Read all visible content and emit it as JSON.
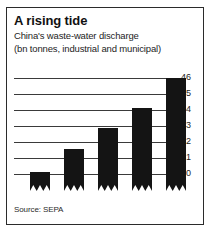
{
  "chart_data": {
    "type": "bar",
    "title": "A rising tide",
    "subtitle_line1": "China's waste-water discharge",
    "subtitle_line2": "(bn tonnes, industrial and municipal)",
    "source": "Source: SEPA",
    "categories": [
      "1999",
      "2000",
      "01",
      "02",
      "03"
    ],
    "values": [
      40.1,
      41.55,
      42.85,
      44.1,
      46.0
    ],
    "xlabel": "",
    "ylabel": "",
    "ylim": [
      39.5,
      46.0
    ],
    "yticks": [
      40,
      41,
      42,
      43,
      44,
      45,
      46
    ],
    "ytick_labels": [
      "40",
      "41",
      "42",
      "43",
      "44",
      "45",
      "46"
    ],
    "grid": true,
    "legend": false,
    "axis_break": true,
    "bar_color": "#141414",
    "grid_color": "#3a3a3a"
  },
  "figure": {
    "border_color": "#2b2b2b",
    "background": "#ffffff",
    "text_color": "#1d1d1d"
  }
}
